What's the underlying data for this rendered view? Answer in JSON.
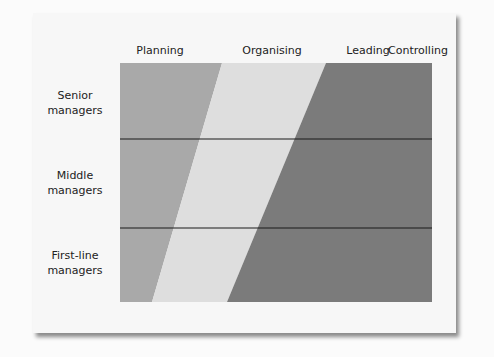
{
  "diagram": {
    "columns": [
      {
        "label": "Planning",
        "x": 150
      },
      {
        "label": "Organising",
        "x": 270
      },
      {
        "label": "Leading",
        "x": 368
      },
      {
        "label": "Controlling",
        "x": 420
      }
    ],
    "rows": [
      {
        "label_line1": "Senior",
        "label_line2": "managers"
      },
      {
        "label_line1": "Middle",
        "label_line2": "managers"
      },
      {
        "label_line1": "First-line",
        "label_line2": "managers"
      }
    ],
    "bands": [
      {
        "name": "planning-band",
        "color": "#a9a9a9"
      },
      {
        "name": "organising-band",
        "color": "#dedede"
      },
      {
        "name": "leading-controlling-band",
        "color": "#7b7b7b"
      }
    ],
    "divider_color": "#1a1a1a"
  }
}
